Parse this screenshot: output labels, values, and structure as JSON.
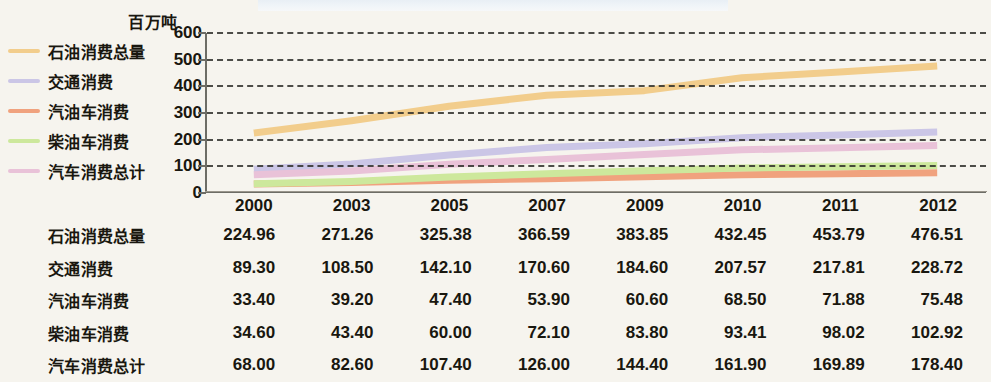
{
  "unit_label": "百万吨",
  "legend": {
    "items": [
      {
        "label": "石油消费总量",
        "color": "#f2cd8c"
      },
      {
        "label": "交通消费",
        "color": "#cbc6e6"
      },
      {
        "label": "汽油车消费",
        "color": "#f0a27e"
      },
      {
        "label": "柴油车消费",
        "color": "#cde89c"
      },
      {
        "label": "汽车消费总计",
        "color": "#e9c2d8"
      }
    ]
  },
  "chart_data": {
    "type": "line",
    "title": "",
    "xlabel": "",
    "ylabel": "百万吨",
    "ylim": [
      0,
      600
    ],
    "yticks": [
      0,
      100,
      200,
      300,
      400,
      500,
      600
    ],
    "grid": true,
    "legend_position": "left",
    "categories": [
      "2000",
      "2003",
      "2005",
      "2007",
      "2009",
      "2010",
      "2011",
      "2012"
    ],
    "series": [
      {
        "name": "石油消费总量",
        "color": "#f2cd8c",
        "values": [
          224.96,
          271.26,
          325.38,
          366.59,
          383.85,
          432.45,
          453.79,
          476.51
        ]
      },
      {
        "name": "交通消费",
        "color": "#cbc6e6",
        "values": [
          89.3,
          108.5,
          142.1,
          170.6,
          184.6,
          207.57,
          217.81,
          228.72
        ]
      },
      {
        "name": "汽油车消费",
        "color": "#f0a27e",
        "values": [
          33.4,
          39.2,
          47.4,
          53.9,
          60.6,
          68.5,
          71.88,
          75.48
        ]
      },
      {
        "name": "柴油车消费",
        "color": "#cde89c",
        "values": [
          34.6,
          43.4,
          60.0,
          72.1,
          83.8,
          93.41,
          98.02,
          102.92
        ]
      },
      {
        "name": "汽车消费总计",
        "color": "#e9c2d8",
        "values": [
          68.0,
          82.6,
          107.4,
          126.0,
          144.4,
          161.9,
          169.89,
          178.4
        ]
      }
    ]
  },
  "table": {
    "columns": [
      "2000",
      "2003",
      "2005",
      "2007",
      "2009",
      "2010",
      "2011",
      "2012"
    ],
    "rows": [
      {
        "label": "石油消费总量",
        "values": [
          "224.96",
          "271.26",
          "325.38",
          "366.59",
          "383.85",
          "432.45",
          "453.79",
          "476.51"
        ]
      },
      {
        "label": "交通消费",
        "values": [
          "89.30",
          "108.50",
          "142.10",
          "170.60",
          "184.60",
          "207.57",
          "217.81",
          "228.72"
        ]
      },
      {
        "label": "汽油车消费",
        "values": [
          "33.40",
          "39.20",
          "47.40",
          "53.90",
          "60.60",
          "68.50",
          "71.88",
          "75.48"
        ]
      },
      {
        "label": "柴油车消费",
        "values": [
          "34.60",
          "43.40",
          "60.00",
          "72.10",
          "83.80",
          "93.41",
          "98.02",
          "102.92"
        ]
      },
      {
        "label": "汽车消费总计",
        "values": [
          "68.00",
          "82.60",
          "107.40",
          "126.00",
          "144.40",
          "161.90",
          "169.89",
          "178.40"
        ]
      }
    ]
  }
}
